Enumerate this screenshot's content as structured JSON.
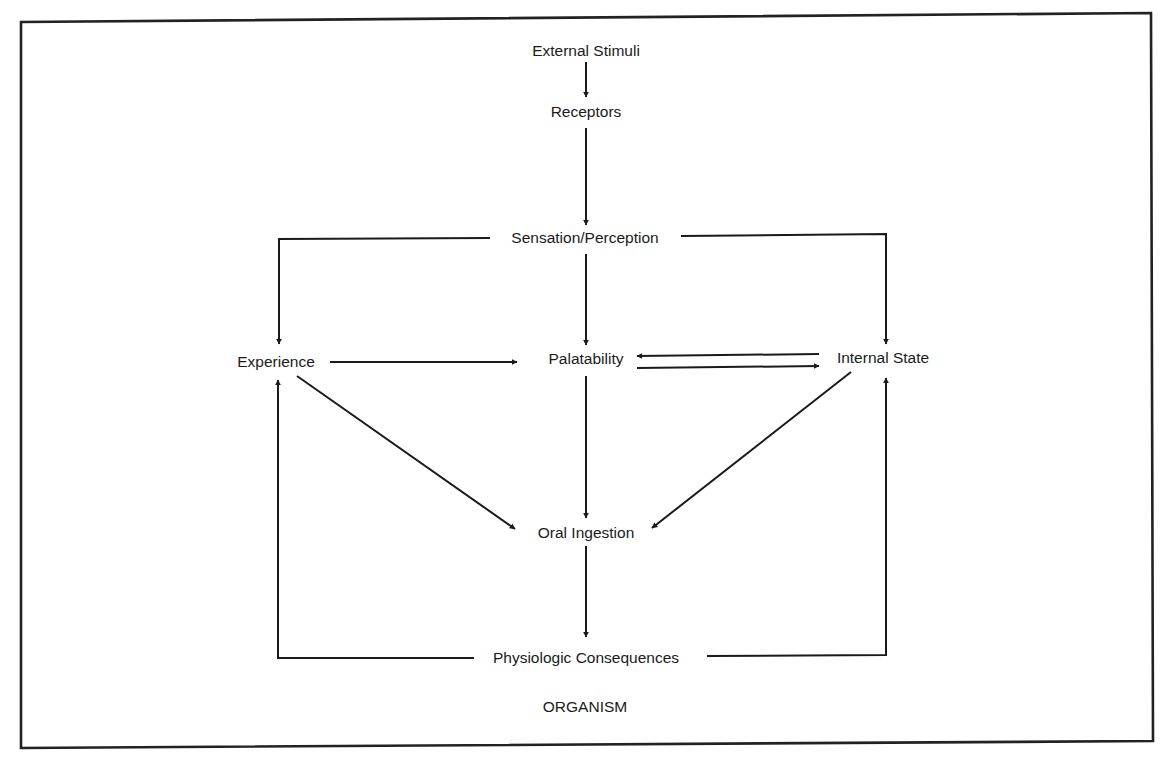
{
  "diagram": {
    "title": "",
    "container_label": "ORGANISM",
    "nodes": {
      "external_stimuli": "External Stimuli",
      "receptors": "Receptors",
      "sensation_perception": "Sensation/Perception",
      "experience": "Experience",
      "palatability": "Palatability",
      "internal_state": "Internal State",
      "oral_ingestion": "Oral Ingestion",
      "physiologic_consequences": "Physiologic Consequences"
    },
    "edges": [
      {
        "from": "External Stimuli",
        "to": "Receptors"
      },
      {
        "from": "Receptors",
        "to": "Sensation/Perception"
      },
      {
        "from": "Sensation/Perception",
        "to": "Experience"
      },
      {
        "from": "Sensation/Perception",
        "to": "Palatability"
      },
      {
        "from": "Sensation/Perception",
        "to": "Internal State"
      },
      {
        "from": "Experience",
        "to": "Palatability"
      },
      {
        "from": "Internal State",
        "to": "Palatability"
      },
      {
        "from": "Palatability",
        "to": "Internal State"
      },
      {
        "from": "Experience",
        "to": "Oral Ingestion"
      },
      {
        "from": "Palatability",
        "to": "Oral Ingestion"
      },
      {
        "from": "Internal State",
        "to": "Oral Ingestion"
      },
      {
        "from": "Oral Ingestion",
        "to": "Physiologic Consequences"
      },
      {
        "from": "Physiologic Consequences",
        "to": "Experience"
      },
      {
        "from": "Physiologic Consequences",
        "to": "Internal State"
      }
    ],
    "colors": {
      "line": "#1a1a1a",
      "background": "#ffffff"
    }
  }
}
